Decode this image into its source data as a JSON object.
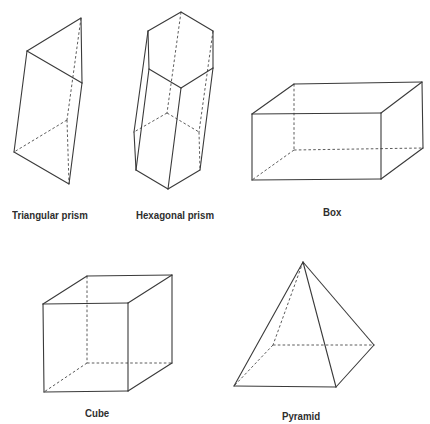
{
  "figure": {
    "title": "",
    "colors": {
      "line": "#3a3a3a",
      "label": "#2e2e2e",
      "background": "#ffffff"
    },
    "shapes": [
      {
        "id": "triangular-prism",
        "label": "Triangular prism",
        "label_pos": [
          12,
          209
        ],
        "vertices": {
          "t1": [
            27,
            51
          ],
          "t2": [
            81,
            18
          ],
          "t3": [
            82,
            83
          ],
          "b1": [
            14,
            152
          ],
          "b2": [
            67,
            120
          ],
          "b3": [
            69,
            184
          ]
        },
        "solid": [
          [
            "t1",
            "t2"
          ],
          [
            "t2",
            "t3"
          ],
          [
            "t3",
            "t1"
          ],
          [
            "t1",
            "b1"
          ],
          [
            "t3",
            "b3"
          ],
          [
            "b1",
            "b3"
          ]
        ],
        "hidden": [
          [
            "t2",
            "b2"
          ],
          [
            "b2",
            "b1"
          ],
          [
            "b2",
            "b3"
          ]
        ]
      },
      {
        "id": "hexagonal-prism",
        "label": "Hexagonal prism",
        "label_pos": [
          136,
          209
        ],
        "vertices": {
          "t1": [
            181,
            12
          ],
          "t2": [
            213,
            31
          ],
          "t3": [
            213,
            68
          ],
          "t4": [
            181,
            88
          ],
          "t5": [
            149,
            69
          ],
          "t6": [
            148,
            31
          ],
          "b1": [
            167,
            113
          ],
          "b2": [
            199,
            132
          ],
          "b3": [
            200,
            170
          ],
          "b4": [
            168,
            189
          ],
          "b5": [
            136,
            170
          ],
          "b6": [
            134,
            132
          ]
        },
        "solid": [
          [
            "t1",
            "t2"
          ],
          [
            "t2",
            "t3"
          ],
          [
            "t3",
            "t4"
          ],
          [
            "t4",
            "t5"
          ],
          [
            "t5",
            "t6"
          ],
          [
            "t6",
            "t1"
          ],
          [
            "t6",
            "b6"
          ],
          [
            "t5",
            "b5"
          ],
          [
            "t4",
            "b4"
          ],
          [
            "t3",
            "b3"
          ],
          [
            "b3",
            "b4"
          ],
          [
            "b4",
            "b5"
          ],
          [
            "b5",
            "b6"
          ]
        ],
        "hidden": [
          [
            "t1",
            "b1"
          ],
          [
            "t2",
            "b2"
          ],
          [
            "b1",
            "b2"
          ],
          [
            "b1",
            "b6"
          ],
          [
            "b2",
            "b3"
          ]
        ]
      },
      {
        "id": "box",
        "label": "Box",
        "label_pos": [
          323,
          206
        ],
        "vertices": {
          "ftl": [
            252,
            114
          ],
          "ftr": [
            381,
            113
          ],
          "fbl": [
            252,
            180
          ],
          "fbr": [
            381,
            179
          ],
          "btl": [
            294,
            84
          ],
          "btr": [
            422,
            82
          ],
          "bbl": [
            294,
            150
          ],
          "bbr": [
            423,
            148
          ]
        },
        "solid": [
          [
            "ftl",
            "ftr"
          ],
          [
            "ftr",
            "fbr"
          ],
          [
            "fbr",
            "fbl"
          ],
          [
            "fbl",
            "ftl"
          ],
          [
            "ftl",
            "btl"
          ],
          [
            "btl",
            "btr"
          ],
          [
            "btr",
            "ftr"
          ],
          [
            "btr",
            "bbr"
          ],
          [
            "bbr",
            "fbr"
          ]
        ],
        "hidden": [
          [
            "btl",
            "bbl"
          ],
          [
            "bbl",
            "bbr"
          ],
          [
            "bbl",
            "fbl"
          ]
        ]
      },
      {
        "id": "cube",
        "label": "Cube",
        "label_pos": [
          85,
          407
        ],
        "vertices": {
          "ftl": [
            43,
            304
          ],
          "ftr": [
            128,
            303
          ],
          "fbl": [
            44,
            392
          ],
          "fbr": [
            128,
            391
          ],
          "btl": [
            87,
            276
          ],
          "btr": [
            172,
            275
          ],
          "bbl": [
            87,
            363
          ],
          "bbr": [
            172,
            363
          ]
        },
        "solid": [
          [
            "ftl",
            "ftr"
          ],
          [
            "ftr",
            "fbr"
          ],
          [
            "fbr",
            "fbl"
          ],
          [
            "fbl",
            "ftl"
          ],
          [
            "ftl",
            "btl"
          ],
          [
            "btl",
            "btr"
          ],
          [
            "btr",
            "ftr"
          ],
          [
            "btr",
            "bbr"
          ],
          [
            "bbr",
            "fbr"
          ]
        ],
        "hidden": [
          [
            "btl",
            "bbl"
          ],
          [
            "bbl",
            "bbr"
          ],
          [
            "bbl",
            "fbl"
          ]
        ]
      },
      {
        "id": "pyramid",
        "label": "Pyramid",
        "label_pos": [
          282,
          410
        ],
        "vertices": {
          "apex": [
            303,
            262
          ],
          "fl": [
            234,
            386
          ],
          "fr": [
            336,
            387
          ],
          "br": [
            374,
            345
          ],
          "bl": [
            273,
            345
          ]
        },
        "solid": [
          [
            "apex",
            "fl"
          ],
          [
            "apex",
            "fr"
          ],
          [
            "apex",
            "br"
          ],
          [
            "fl",
            "fr"
          ],
          [
            "fr",
            "br"
          ]
        ],
        "hidden": [
          [
            "apex",
            "bl"
          ],
          [
            "bl",
            "fl"
          ],
          [
            "bl",
            "br"
          ]
        ]
      }
    ]
  }
}
